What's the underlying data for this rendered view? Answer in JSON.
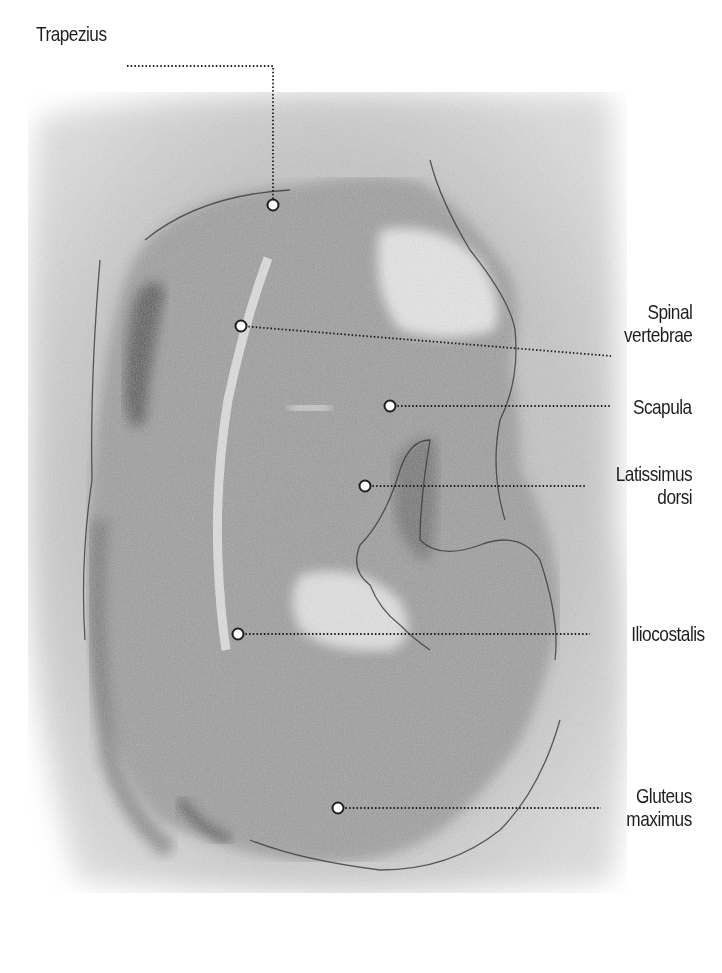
{
  "diagram": {
    "colors": {
      "background": "#ffffff",
      "shading": "#8a8a8a",
      "line": "#2a2a2a",
      "label_text": "#1e1e1e",
      "marker_fill": "#ffffff",
      "marker_stroke": "#1e1e1e"
    },
    "labels": [
      {
        "id": "trapezius",
        "lines": [
          "Trapezius"
        ],
        "side": "left",
        "text_x": 36,
        "text_y": 22,
        "marker": [
          273,
          205
        ],
        "path": [
          [
            127,
            66
          ],
          [
            273,
            66
          ],
          [
            273,
            205
          ]
        ]
      },
      {
        "id": "spinal-vertebrae",
        "lines": [
          "Spinal",
          "vertebrae"
        ],
        "side": "right",
        "text_right": 692,
        "text_y": 300,
        "marker": [
          241,
          326
        ],
        "path": [
          [
            241,
            326
          ],
          [
            611,
            356
          ]
        ]
      },
      {
        "id": "scapula",
        "lines": [
          "Scapula"
        ],
        "side": "right",
        "text_right": 692,
        "text_y": 395,
        "marker": [
          390,
          406
        ],
        "path": [
          [
            390,
            406
          ],
          [
            611,
            406
          ]
        ]
      },
      {
        "id": "latissimus-dorsi",
        "lines": [
          "Latissimus",
          "dorsi"
        ],
        "side": "right",
        "text_right": 692,
        "text_y": 462,
        "marker": [
          365,
          486
        ],
        "path": [
          [
            365,
            486
          ],
          [
            585,
            486
          ]
        ]
      },
      {
        "id": "iliocostalis",
        "lines": [
          "Iliocostalis"
        ],
        "side": "right",
        "text_right": 705,
        "text_y": 622,
        "marker": [
          238,
          634
        ],
        "path": [
          [
            238,
            634
          ],
          [
            590,
            634
          ]
        ]
      },
      {
        "id": "gluteus-maximus",
        "lines": [
          "Gluteus",
          "maximus"
        ],
        "side": "right",
        "text_right": 692,
        "text_y": 784,
        "marker": [
          338,
          808
        ],
        "path": [
          [
            338,
            808
          ],
          [
            601,
            808
          ]
        ]
      }
    ]
  }
}
